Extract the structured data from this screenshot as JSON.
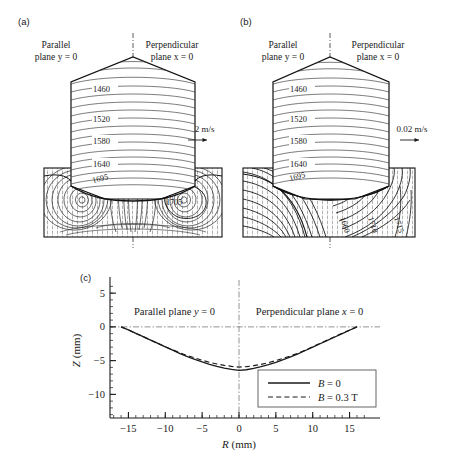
{
  "figure": {
    "panels": [
      {
        "tag": "(a)",
        "left_plane_line1": "Parallel",
        "left_plane_line2": "plane y = 0",
        "right_plane_line1": "Perpendicular",
        "right_plane_line2": "plane x = 0",
        "velocity_scale": "0.02 m/s",
        "crystal_contour_labels": [
          "1460",
          "1520",
          "1580",
          "1640"
        ],
        "melt_contour_labels": [
          "1695",
          "1705"
        ],
        "melt_style": "convection-rolls"
      },
      {
        "tag": "(b)",
        "left_plane_line1": "Parallel",
        "left_plane_line2": "plane y = 0",
        "right_plane_line1": "Perpendicular",
        "right_plane_line2": "plane x = 0",
        "velocity_scale": "0.02 m/s",
        "crystal_contour_labels": [
          "1460",
          "1520",
          "1580",
          "1640"
        ],
        "melt_contour_labels": [
          "1695",
          "1660",
          "1710",
          "1715"
        ],
        "melt_style": "damped-flow"
      }
    ],
    "panel_c": {
      "tag": "(c)",
      "left_region_label": "Parallel plane y = 0",
      "right_region_label": "Perpendicular plane x = 0"
    }
  },
  "chart_data": {
    "type": "line",
    "title": "",
    "xlabel": "R (mm)",
    "ylabel": "Z (mm)",
    "xlim": [
      -17.5,
      17.5
    ],
    "ylim": [
      -13.5,
      6.5
    ],
    "xticks": [
      -15,
      -10,
      -5,
      0,
      5,
      10,
      15
    ],
    "xticklabels": [
      "−15",
      "−10",
      "−5",
      "0",
      "5",
      "10",
      "15"
    ],
    "yticks": [
      5,
      0,
      -5,
      -10
    ],
    "yticklabels": [
      "5",
      "0",
      "−5",
      "−10"
    ],
    "xminor_step": 1,
    "yminor_step": 1,
    "grid": false,
    "legend_position": "lower-right",
    "zero_reference_line": true,
    "center_reference_line": true,
    "series": [
      {
        "name": "B = 0",
        "style": "solid",
        "color": "#1a1a1a",
        "x": [
          -16.0,
          -15.0,
          -14.0,
          -13.0,
          -12.0,
          -11.0,
          -10.0,
          -9.0,
          -8.0,
          -7.0,
          -6.0,
          -5.0,
          -4.0,
          -3.0,
          -2.0,
          -1.0,
          0.0,
          1.0,
          2.0,
          3.0,
          4.0,
          5.0,
          6.0,
          7.0,
          8.0,
          9.0,
          10.0,
          11.0,
          12.0,
          13.0,
          14.0,
          15.0,
          16.0
        ],
        "y": [
          0.0,
          -0.45,
          -0.95,
          -1.45,
          -1.95,
          -2.45,
          -2.95,
          -3.45,
          -3.95,
          -4.4,
          -4.8,
          -5.2,
          -5.55,
          -5.85,
          -6.1,
          -6.3,
          -6.45,
          -6.35,
          -6.15,
          -5.9,
          -5.6,
          -5.25,
          -4.85,
          -4.45,
          -4.0,
          -3.5,
          -3.0,
          -2.5,
          -2.0,
          -1.5,
          -1.0,
          -0.5,
          0.0
        ]
      },
      {
        "name": "B = 0.3 T",
        "style": "dashed",
        "color": "#1a1a1a",
        "x": [
          -16.0,
          -15.0,
          -14.0,
          -13.0,
          -12.0,
          -11.0,
          -10.0,
          -9.0,
          -8.0,
          -7.0,
          -6.0,
          -5.0,
          -4.0,
          -3.0,
          -2.0,
          -1.0,
          0.0,
          1.0,
          2.0,
          3.0,
          4.0,
          5.0,
          6.0,
          7.0,
          8.0,
          9.0,
          10.0,
          11.0,
          12.0,
          13.0,
          14.0,
          15.0,
          16.0
        ],
        "y": [
          0.0,
          -0.45,
          -0.95,
          -1.45,
          -1.95,
          -2.45,
          -2.95,
          -3.4,
          -3.85,
          -4.25,
          -4.6,
          -4.95,
          -5.25,
          -5.5,
          -5.7,
          -5.85,
          -5.95,
          -5.9,
          -5.75,
          -5.55,
          -5.3,
          -5.0,
          -4.65,
          -4.3,
          -3.9,
          -3.45,
          -2.95,
          -2.45,
          -1.95,
          -1.45,
          -0.95,
          -0.48,
          0.0
        ]
      }
    ],
    "legend": [
      {
        "label": "B = 0",
        "style": "solid"
      },
      {
        "label": "B = 0.3 T",
        "style": "dashed"
      }
    ]
  }
}
